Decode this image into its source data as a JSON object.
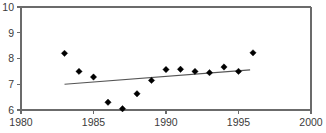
{
  "chart_data": {
    "type": "scatter",
    "title": "",
    "subtitle": "",
    "xlabel": "",
    "ylabel": "",
    "xlim": [
      1980,
      2000
    ],
    "ylim": [
      6,
      10
    ],
    "grid": false,
    "legend": null,
    "x_ticks": [
      1980,
      1985,
      1990,
      1995,
      2000
    ],
    "x_tick_labels": [
      "1980",
      "1985",
      "1990",
      "1995",
      "2000"
    ],
    "y_ticks": [
      6,
      7,
      8,
      9,
      10
    ],
    "y_tick_labels": [
      "6",
      "7",
      "8",
      "9",
      "10"
    ],
    "marker": "diamond",
    "marker_color": "#000000",
    "x": [
      1983,
      1984,
      1985,
      1986,
      1987,
      1988,
      1989,
      1990,
      1991,
      1992,
      1993,
      1994,
      1995,
      1996
    ],
    "values": [
      8.2,
      7.5,
      7.28,
      6.3,
      6.05,
      6.63,
      7.15,
      7.57,
      7.58,
      7.5,
      7.45,
      7.67,
      7.5,
      8.22
    ],
    "series": [
      {
        "name": "observations",
        "type": "scatter",
        "x": [
          1983,
          1984,
          1985,
          1986,
          1987,
          1988,
          1989,
          1990,
          1991,
          1992,
          1993,
          1994,
          1995,
          1996
        ],
        "values": [
          8.2,
          7.5,
          7.28,
          6.3,
          6.05,
          6.63,
          7.15,
          7.57,
          7.58,
          7.5,
          7.45,
          7.67,
          7.5,
          8.22
        ]
      },
      {
        "name": "trend-line",
        "type": "line",
        "x": [
          1983,
          1995.8
        ],
        "values": [
          7.0,
          7.56
        ],
        "color": "#555555"
      }
    ],
    "annotations": []
  },
  "axes": {
    "line_color": "#6b6b6b",
    "tick_color": "#6b6b6b",
    "label_color": "#3b3b3b"
  }
}
